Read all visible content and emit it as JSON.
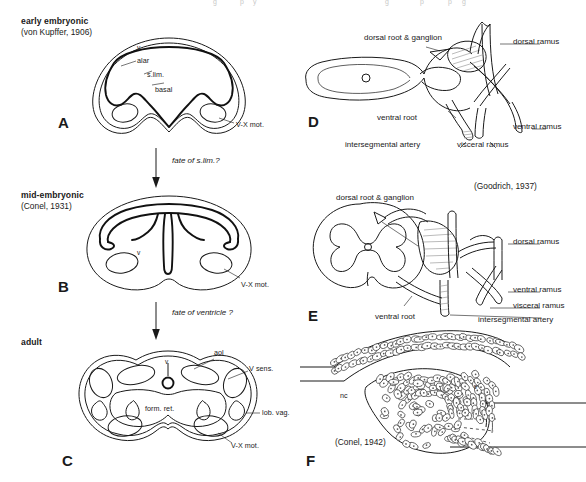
{
  "figure": {
    "panels": [
      "A",
      "B",
      "C",
      "D",
      "E",
      "F"
    ]
  },
  "left_column": {
    "stages": [
      {
        "title": "early embryonic",
        "citation": "(von Kupffer, 1906)",
        "panel": "A"
      },
      {
        "title": "mid-embryonic",
        "citation": "(Conel, 1931)",
        "panel": "B"
      },
      {
        "title": "adult",
        "citation": "",
        "panel": "C"
      }
    ],
    "arrows": [
      {
        "note": "fate of s.lim.?"
      },
      {
        "note": "fate of ventricle ?"
      }
    ]
  },
  "panel_a": {
    "letter": "A",
    "labels": {
      "ventricle": "v",
      "alar": "alar",
      "sulcus_limitans": "s.lim.",
      "basal": "basal",
      "motor": "V-X mot."
    }
  },
  "panel_b": {
    "letter": "B",
    "labels": {
      "ventricle": "v",
      "motor": "V-X mot."
    }
  },
  "panel_c": {
    "letter": "C",
    "labels": {
      "ventricle": "v",
      "acousticolateral": "aol",
      "trigeminal_sensory": "V sens.",
      "formatio_reticularis": "form. ret.",
      "lobus_vagi": "lob. vag.",
      "motor": "V-X mot."
    }
  },
  "panel_d": {
    "letter": "D",
    "labels": {
      "dorsal_root_ganglion": "dorsal root & ganglion",
      "dorsal_ramus": "dorsal ramus",
      "ventral_root": "ventral root",
      "ventral_ramus": "ventral ramus",
      "intersegmental_artery": "intersegmental artery",
      "visceral_ramus": "visceral ramus"
    }
  },
  "panel_e": {
    "letter": "E",
    "citation": "(Goodrich, 1937)",
    "labels": {
      "dorsal_root_ganglion": "dorsal root & ganglion",
      "dorsal_ramus": "dorsal ramus",
      "ventral_root": "ventral root",
      "ventral_ramus": "ventral ramus",
      "visceral_ramus": "visceral ramus",
      "intersegmental_artery": "intersegmental artery"
    }
  },
  "panel_f": {
    "letter": "F",
    "citation": "(Conel, 1942)",
    "labels": {
      "notochord": "nc",
      "ventricle": "v"
    }
  },
  "colors": {
    "ink": "#1a1a1a",
    "background": "#ffffff",
    "shading": "#777777"
  }
}
